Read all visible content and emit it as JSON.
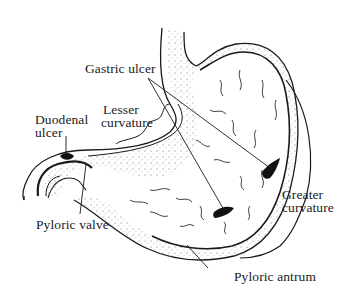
{
  "diagram": {
    "labels": {
      "gastric_ulcer": "Gastric ulcer",
      "lesser_curvature_line1": "Lesser",
      "lesser_curvature_line2": "curvature",
      "duodenal_ulcer_line1": "Duodenal",
      "duodenal_ulcer_line2": "ulcer",
      "pyloric_valve": "Pyloric valve",
      "greater_curvature_line1": "Greater",
      "greater_curvature_line2": "curvature",
      "pyloric_antrum": "Pyloric antrum"
    },
    "colors": {
      "ink": "#1a1a1a",
      "stipple": "#6a6a6a",
      "background": "#ffffff"
    }
  }
}
